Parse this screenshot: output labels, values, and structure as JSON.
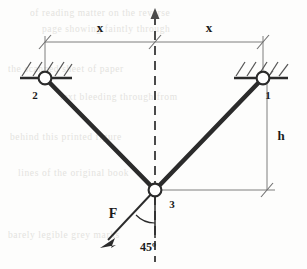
{
  "figure": {
    "type": "engineering-statics-diagram"
  },
  "colors": {
    "member": "#2b2b2b",
    "dimension": "#6f6f6f",
    "centerline": "#4a4a4a",
    "hatch": "#555555",
    "background": "#fdfdfc",
    "joint_fill": "#ffffff"
  },
  "dimensions": {
    "left_span_label": "x",
    "right_span_label": "x",
    "height_label": "h"
  },
  "joints": [
    {
      "id": "1",
      "label": "1",
      "role": "right-pin-support",
      "x": 263,
      "y": 78
    },
    {
      "id": "2",
      "label": "2",
      "role": "left-pin-support",
      "x": 45,
      "y": 78
    },
    {
      "id": "3",
      "label": "3",
      "role": "bottom-loaded-joint",
      "x": 155,
      "y": 190
    }
  ],
  "members": [
    {
      "name": "member-2-3",
      "from": "2",
      "to": "3"
    },
    {
      "name": "member-1-3",
      "from": "1",
      "to": "3"
    }
  ],
  "load": {
    "symbol": "F",
    "angle_label": "45º",
    "angle_degrees": 45,
    "direction": "down-left",
    "applied_at_joint": "3"
  },
  "centerline": {
    "style": "dashed",
    "has_top_arrow": true
  },
  "background_text": [
    "of reading  matter  on  the  reverse",
    "page  showing  faintly  through",
    "the  scanned  sheet  of  paper",
    "text  bleeding  through  from",
    "behind  this  printed  figure",
    "lines  of  the  original  book",
    "barely  legible  grey  marks"
  ]
}
